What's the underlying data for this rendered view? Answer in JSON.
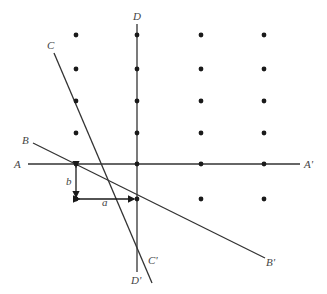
{
  "diagram": {
    "type": "lattice-lines",
    "colors": {
      "line": "#333333",
      "dot": "#1a1a1a",
      "label": "#444444"
    },
    "lines": [
      {
        "id": "A",
        "start_label": "A",
        "end_label": "A'",
        "x1": 28,
        "y1": 164,
        "x2": 300,
        "y2": 164
      },
      {
        "id": "B",
        "start_label": "B",
        "end_label": "B'",
        "x1": 33,
        "y1": 143,
        "x2": 265,
        "y2": 258
      },
      {
        "id": "C",
        "start_label": "C",
        "end_label": "C'",
        "x1": 54,
        "y1": 53,
        "x2": 152,
        "y2": 283
      },
      {
        "id": "D",
        "start_label": "D",
        "end_label": "D'",
        "x1": 137,
        "y1": 24,
        "x2": 137,
        "y2": 272
      }
    ],
    "labels": [
      {
        "text": "D",
        "x": 133,
        "y": 20
      },
      {
        "text": "C",
        "x": 47,
        "y": 49
      },
      {
        "text": "B",
        "x": 22,
        "y": 144
      },
      {
        "text": "A",
        "x": 14,
        "y": 168
      },
      {
        "text": "A'",
        "x": 304,
        "y": 168
      },
      {
        "text": "B'",
        "x": 266,
        "y": 266
      },
      {
        "text": "C'",
        "x": 148,
        "y": 264
      },
      {
        "text": "D'",
        "x": 131,
        "y": 284
      },
      {
        "text": "b",
        "x": 66,
        "y": 185
      },
      {
        "text": "a",
        "x": 102,
        "y": 206
      }
    ],
    "dots": [
      [
        76,
        35
      ],
      [
        137,
        35
      ],
      [
        201,
        35
      ],
      [
        264,
        35
      ],
      [
        76,
        69
      ],
      [
        137,
        69
      ],
      [
        201,
        69
      ],
      [
        264,
        69
      ],
      [
        76,
        101
      ],
      [
        137,
        101
      ],
      [
        201,
        101
      ],
      [
        264,
        101
      ],
      [
        76,
        133
      ],
      [
        137,
        133
      ],
      [
        201,
        133
      ],
      [
        264,
        133
      ],
      [
        76,
        164
      ],
      [
        137,
        164
      ],
      [
        201,
        164
      ],
      [
        264,
        164
      ],
      [
        76,
        199
      ],
      [
        137,
        199
      ],
      [
        201,
        199
      ],
      [
        264,
        199
      ]
    ],
    "vectors": [
      {
        "name": "b",
        "x1": 76,
        "y1": 167,
        "x2": 76,
        "y2": 197
      },
      {
        "name": "a",
        "x1": 79,
        "y1": 199,
        "x2": 134,
        "y2": 199
      }
    ]
  }
}
